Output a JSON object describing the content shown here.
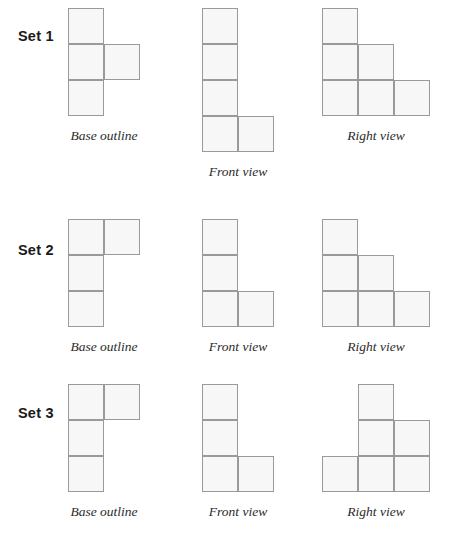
{
  "page": {
    "cell_size": 36,
    "fill_color": "#f7f7f7",
    "border_color": "#9a9a9a",
    "background_color": "#ffffff",
    "label_color": "#1a1a1a",
    "caption_color": "#2b2b2b"
  },
  "captions": {
    "base": "Base outline",
    "front": "Front view",
    "right": "Right view"
  },
  "sets": [
    {
      "label": "Set 1",
      "figures": {
        "base": {
          "caption": "Base outline",
          "rows": 3,
          "cols": 2,
          "cells": [
            [
              1,
              1
            ],
            [
              2,
              1
            ],
            [
              2,
              2
            ],
            [
              3,
              1
            ]
          ]
        },
        "front": {
          "caption": "Front view",
          "rows": 4,
          "cols": 2,
          "cells": [
            [
              1,
              1
            ],
            [
              2,
              1
            ],
            [
              3,
              1
            ],
            [
              4,
              1
            ],
            [
              4,
              2
            ]
          ]
        },
        "right": {
          "caption": "Right view",
          "rows": 3,
          "cols": 3,
          "cells": [
            [
              1,
              1
            ],
            [
              2,
              1
            ],
            [
              2,
              2
            ],
            [
              3,
              1
            ],
            [
              3,
              2
            ],
            [
              3,
              3
            ]
          ]
        }
      }
    },
    {
      "label": "Set 2",
      "figures": {
        "base": {
          "caption": "Base outline",
          "rows": 3,
          "cols": 2,
          "cells": [
            [
              1,
              1
            ],
            [
              1,
              2
            ],
            [
              2,
              1
            ],
            [
              3,
              1
            ]
          ]
        },
        "front": {
          "caption": "Front view",
          "rows": 3,
          "cols": 2,
          "cells": [
            [
              1,
              1
            ],
            [
              2,
              1
            ],
            [
              3,
              1
            ],
            [
              3,
              2
            ]
          ]
        },
        "right": {
          "caption": "Right view",
          "rows": 3,
          "cols": 3,
          "cells": [
            [
              1,
              1
            ],
            [
              2,
              1
            ],
            [
              2,
              2
            ],
            [
              3,
              1
            ],
            [
              3,
              2
            ],
            [
              3,
              3
            ]
          ]
        }
      }
    },
    {
      "label": "Set 3",
      "figures": {
        "base": {
          "caption": "Base outline",
          "rows": 3,
          "cols": 2,
          "cells": [
            [
              1,
              1
            ],
            [
              1,
              2
            ],
            [
              2,
              1
            ],
            [
              3,
              1
            ]
          ]
        },
        "front": {
          "caption": "Front view",
          "rows": 3,
          "cols": 2,
          "cells": [
            [
              1,
              1
            ],
            [
              2,
              1
            ],
            [
              3,
              1
            ],
            [
              3,
              2
            ]
          ]
        },
        "right": {
          "caption": "Right view",
          "rows": 3,
          "cols": 3,
          "cells": [
            [
              1,
              2
            ],
            [
              2,
              2
            ],
            [
              2,
              3
            ],
            [
              3,
              1
            ],
            [
              3,
              2
            ],
            [
              3,
              3
            ]
          ]
        }
      }
    }
  ]
}
